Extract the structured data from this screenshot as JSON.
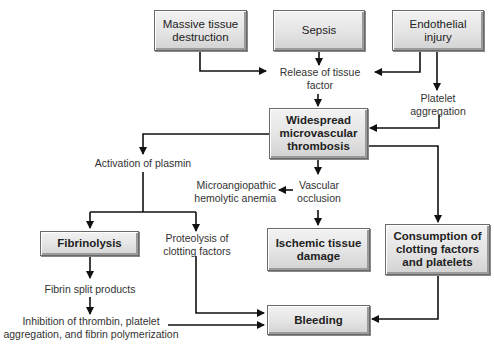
{
  "diagram": {
    "type": "flowchart",
    "nodes": {
      "massive_tissue": "Massive tissue destruction",
      "massive_tissue_l1": "Massive tissue",
      "massive_tissue_l2": "destruction",
      "sepsis": "Sepsis",
      "endothelial_l1": "Endothelial",
      "endothelial_l2": "injury",
      "widespread_l1": "Widespread",
      "widespread_l2": "microvascular",
      "widespread_l3": "thrombosis",
      "fibrinolysis": "Fibrinolysis",
      "ischemic_l1": "Ischemic tissue",
      "ischemic_l2": "damage",
      "consumption_l1": "Consumption of",
      "consumption_l2": "clotting factors",
      "consumption_l3": "and platelets",
      "bleeding": "Bleeding"
    },
    "labels": {
      "release_l1": "Release of tissue",
      "release_l2": "factor",
      "platelet_l1": "Platelet",
      "platelet_l2": "aggregation",
      "activation": "Activation of plasmin",
      "micro_l1": "Microangiopathic",
      "micro_l2": "hemolytic anemia",
      "vascular_l1": "Vascular",
      "vascular_l2": "occlusion",
      "proteolysis_l1": "Proteolysis of",
      "proteolysis_l2": "clotting factors",
      "fibrin_split": "Fibrin split products",
      "inhibition_l1": "Inhibition of thrombin, platelet",
      "inhibition_l2": "aggregation, and fibrin polymerization"
    },
    "colors": {
      "box_fill": "#e4e4e4",
      "box_border": "#6a6a6a",
      "line": "#111111",
      "text": "#222222"
    }
  }
}
